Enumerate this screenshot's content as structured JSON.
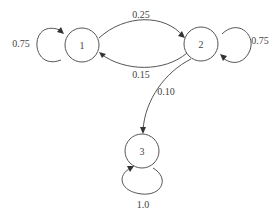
{
  "diagram": {
    "type": "markov-chain-state-diagram",
    "nodes": [
      {
        "id": "1",
        "label": "1",
        "cx": 82,
        "cy": 45,
        "r": 17
      },
      {
        "id": "2",
        "label": "2",
        "cx": 201,
        "cy": 44,
        "r": 17
      },
      {
        "id": "3",
        "label": "3",
        "cx": 142,
        "cy": 151,
        "r": 17
      }
    ],
    "edges": [
      {
        "from": "1",
        "to": "1",
        "label": "0.75",
        "kind": "self-loop"
      },
      {
        "from": "1",
        "to": "2",
        "label": "0.25",
        "kind": "transition"
      },
      {
        "from": "2",
        "to": "1",
        "label": "0.15",
        "kind": "transition"
      },
      {
        "from": "2",
        "to": "2",
        "label": "0.75",
        "kind": "self-loop"
      },
      {
        "from": "2",
        "to": "3",
        "label": "0.10",
        "kind": "transition"
      },
      {
        "from": "3",
        "to": "3",
        "label": "1.0",
        "kind": "self-loop"
      }
    ],
    "colors": {
      "stroke": "#555555",
      "text": "#444444",
      "background": "#ffffff"
    }
  }
}
